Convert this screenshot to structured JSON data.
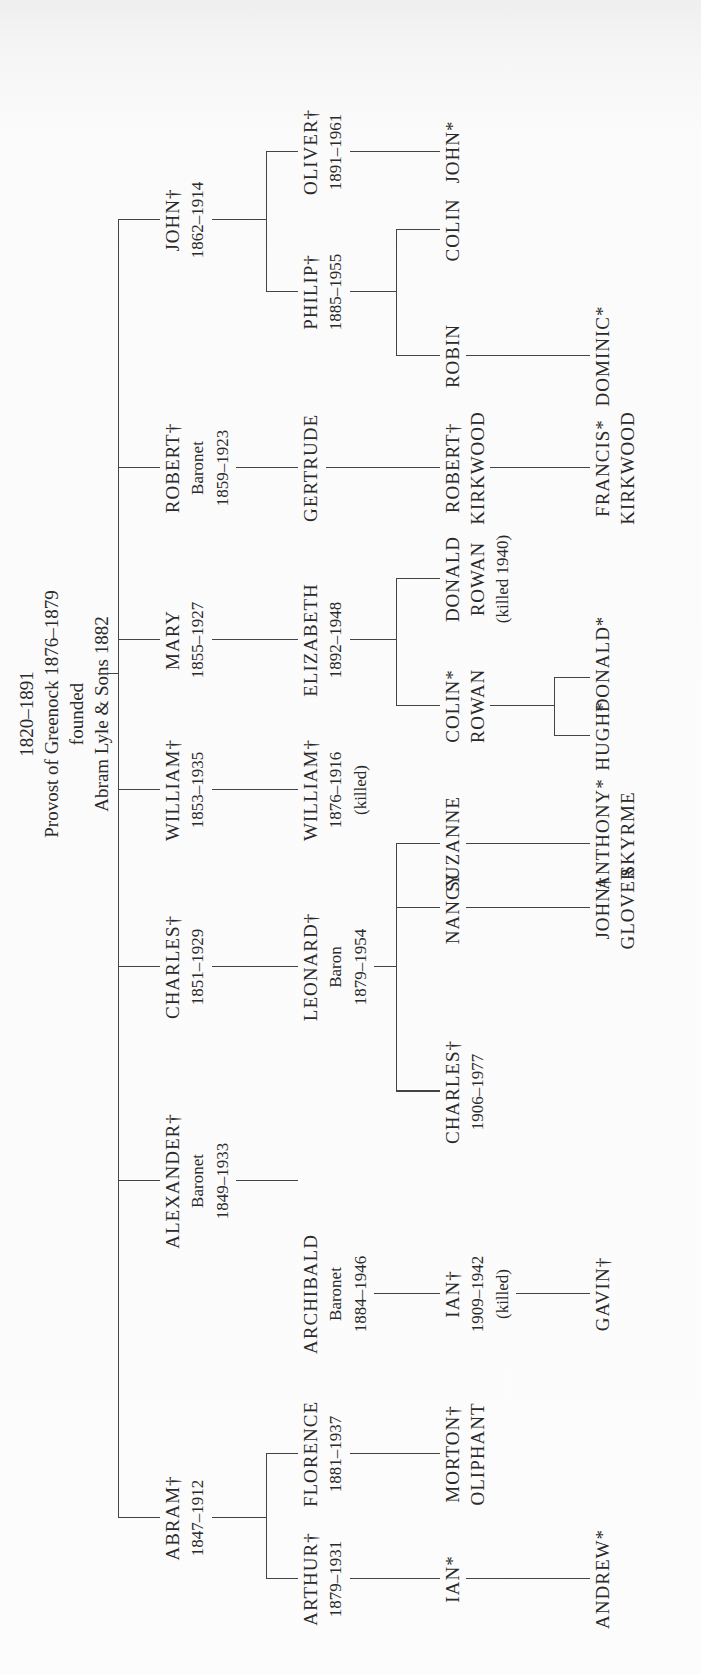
{
  "root": {
    "lines": [
      "1820–1891",
      "Provost of Greenock 1876–1879",
      "founded",
      "Abram Lyle & Sons 1882"
    ]
  },
  "gen1": [
    {
      "name": "ABRAM†",
      "lines": [
        "1847–1912"
      ]
    },
    {
      "name": "ALEXANDER†",
      "lines": [
        "Baronet",
        "1849–1933"
      ]
    },
    {
      "name": "CHARLES†",
      "lines": [
        "1851–1929"
      ]
    },
    {
      "name": "WILLIAM†",
      "lines": [
        "1853–1935"
      ]
    },
    {
      "name": "MARY",
      "lines": [
        "1855–1927"
      ]
    },
    {
      "name": "ROBERT†",
      "lines": [
        "Baronet",
        "1859–1923"
      ]
    },
    {
      "name": "JOHN†",
      "lines": [
        "1862–1914"
      ]
    }
  ],
  "gen2": [
    {
      "name": "ARTHUR†",
      "lines": [
        "1879–1931"
      ],
      "parent": "ABRAM†"
    },
    {
      "name": "FLORENCE",
      "lines": [
        "1881–1937"
      ],
      "parent": "ABRAM†"
    },
    {
      "name": "ARCHIBALD",
      "lines": [
        "Baronet",
        "1884–1946"
      ],
      "parent": "ALEXANDER†"
    },
    {
      "name": "LEONARD†",
      "lines": [
        "Baron",
        "1879–1954"
      ],
      "parent": "CHARLES†"
    },
    {
      "name": "WILLIAM†",
      "lines": [
        "1876–1916",
        "(killed)"
      ],
      "parent": "WILLIAM†"
    },
    {
      "name": "ELIZABETH",
      "lines": [
        "1892–1948"
      ],
      "parent": "MARY"
    },
    {
      "name": "GERTRUDE",
      "lines": [],
      "parent": "ROBERT†"
    },
    {
      "name": "PHILIP†",
      "lines": [
        "1885–1955"
      ],
      "parent": "JOHN†"
    },
    {
      "name": "OLIVER†",
      "lines": [
        "1891–1961"
      ],
      "parent": "JOHN†"
    }
  ],
  "gen3": [
    {
      "name": "IAN*",
      "lines": [],
      "parent": "ARTHUR†"
    },
    {
      "name": "MORTON†",
      "lines": [
        "OLIPHANT"
      ],
      "parent": "FLORENCE"
    },
    {
      "name": "IAN†",
      "lines": [
        "1909–1942",
        "(killed)"
      ],
      "parent": "ARCHIBALD"
    },
    {
      "name": "CHARLES†",
      "lines": [
        "1906–1977"
      ],
      "parent": "LEONARD†"
    },
    {
      "name": "NANCY",
      "lines": [],
      "parent": "LEONARD†"
    },
    {
      "name": "SUZANNE",
      "lines": [],
      "parent": "LEONARD†"
    },
    {
      "name": "COLIN*",
      "lines": [
        "ROWAN"
      ],
      "parent": "ELIZABETH"
    },
    {
      "name": "DONALD",
      "lines": [
        "ROWAN",
        "(killed 1940)"
      ],
      "parent": "ELIZABETH"
    },
    {
      "name": "ROBERT†",
      "lines": [
        "KIRKWOOD"
      ],
      "parent": "GERTRUDE"
    },
    {
      "name": "ROBIN",
      "lines": [],
      "parent": "PHILIP†"
    },
    {
      "name": "COLIN",
      "lines": [],
      "parent": "PHILIP†"
    },
    {
      "name": "JOHN*",
      "lines": [],
      "parent": "OLIVER†"
    }
  ],
  "gen4": [
    {
      "name": "ANDREW*",
      "lines": [],
      "parent": "IAN*"
    },
    {
      "name": "GAVIN†",
      "lines": [],
      "parent": "IAN†"
    },
    {
      "name": "JOHN†",
      "lines": [
        "GLOVER"
      ],
      "parent": "NANCY"
    },
    {
      "name": "ANTHONY*",
      "lines": [
        "SKYRME"
      ],
      "parent": "SUZANNE"
    },
    {
      "name": "HUGH*",
      "lines": [],
      "parent": "COLIN* ROWAN"
    },
    {
      "name": "DONALD*",
      "lines": [],
      "parent": "COLIN* ROWAN"
    },
    {
      "name": "FRANCIS*",
      "lines": [
        "KIRKWOOD"
      ],
      "parent": "ROBERT† KIRKWOOD"
    },
    {
      "name": "DOMINIC*",
      "lines": [],
      "parent": "ROBIN"
    }
  ]
}
